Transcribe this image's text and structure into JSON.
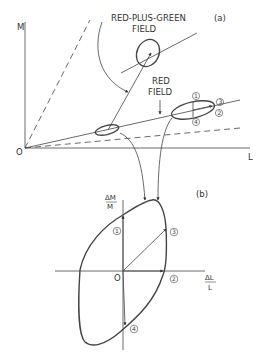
{
  "panel_a": {
    "tag": "(a)",
    "axis_y_label": "M",
    "axis_x_label": "L",
    "origin_label": "O",
    "label_rpg_line1": "RED-PLUS-GREEN",
    "label_rpg_line2": "FIELD",
    "label_red_line1": "RED",
    "label_red_line2": "FIELD",
    "markers": [
      "1",
      "2",
      "3",
      "4"
    ]
  },
  "panel_b": {
    "tag": "(b)",
    "axis_y_label_num": "ΔM",
    "axis_y_label_den": "M",
    "axis_x_label_num": "ΔL",
    "axis_x_label_den": "L",
    "origin_label": "O",
    "markers": [
      "1",
      "2",
      "3",
      "4"
    ]
  },
  "colors": {
    "line": "#333333",
    "background": "#ffffff"
  }
}
